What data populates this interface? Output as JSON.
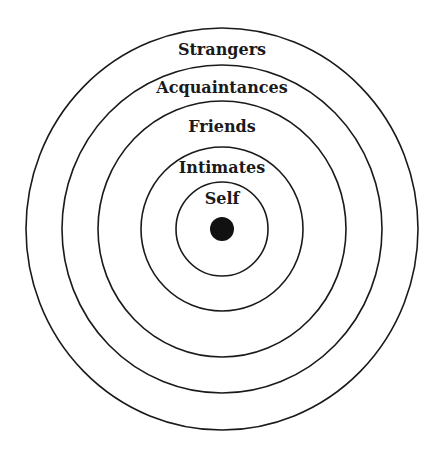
{
  "diagram": {
    "type": "concentric-circles",
    "center": {
      "x": 222,
      "y": 229
    },
    "core": {
      "label": "Self-core dot",
      "radius": 12,
      "color": "#111111"
    },
    "rings": [
      {
        "label": "Self",
        "rx": 46,
        "ry": 47,
        "label_y": 204
      },
      {
        "label": "Intimates",
        "rx": 81,
        "ry": 82,
        "label_y": 173
      },
      {
        "label": "Friends",
        "rx": 124,
        "ry": 128,
        "label_y": 132
      },
      {
        "label": "Acquaintances",
        "rx": 160,
        "ry": 164,
        "label_y": 93
      },
      {
        "label": "Strangers",
        "rx": 196,
        "ry": 201,
        "label_y": 55
      }
    ],
    "stroke_color": "#1a1a1a",
    "background": "#ffffff"
  }
}
